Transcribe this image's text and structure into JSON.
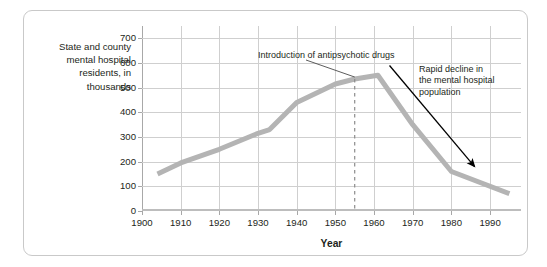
{
  "figure": {
    "y_caption": "State and county\nmental hospital\nresidents, in\nthousands",
    "x_title": "Year"
  },
  "annotations": {
    "drugs": "Introduction of antipsychotic drugs",
    "decline": "Rapid decline in\nthe mental hospital\npopulation"
  },
  "colors": {
    "line": "#b4b4b4",
    "grid": "#cfcfcf",
    "axis": "#a8a8a8",
    "text": "#231f20",
    "frame": "#c9c9c9",
    "arrow": "#000000"
  },
  "chart_data": {
    "type": "line",
    "title": "",
    "xlabel": "Year",
    "ylabel": "State and county mental hospital residents, in thousands",
    "xlim": [
      1900,
      1998
    ],
    "ylim": [
      0,
      750
    ],
    "yticks": [
      0,
      100,
      200,
      300,
      400,
      500,
      600,
      700
    ],
    "xticks": [
      1900,
      1910,
      1920,
      1930,
      1940,
      1950,
      1960,
      1970,
      1980,
      1990
    ],
    "grid": true,
    "legend": "none",
    "series": [
      {
        "name": "State and county mental hospital residents (thousands)",
        "x": [
          1904,
          1910,
          1920,
          1930,
          1933,
          1940,
          1950,
          1955,
          1961,
          1970,
          1980,
          1995
        ],
        "values": [
          150,
          195,
          250,
          315,
          330,
          440,
          515,
          535,
          550,
          350,
          160,
          70
        ]
      }
    ],
    "markers": [
      {
        "type": "vertical-dashed-line",
        "x": 1955,
        "label": "Introduction of antipsychotic drugs"
      },
      {
        "type": "arrow",
        "from_x": 1964,
        "from_y": 590,
        "to_x": 1986,
        "to_y": 180,
        "label": "Rapid decline in the mental hospital population"
      }
    ]
  },
  "ytick_labels": [
    "700",
    "600",
    "500",
    "400",
    "300",
    "200",
    "100",
    "0"
  ],
  "xtick_labels": [
    "1900",
    "1910",
    "1920",
    "1930",
    "1940",
    "1950",
    "1960",
    "1970",
    "1980",
    "1990"
  ]
}
